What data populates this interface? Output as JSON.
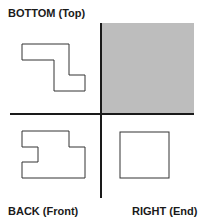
{
  "diagram": {
    "views": [
      {
        "id": "bottom",
        "label": "BOTTOM (Top)",
        "position": "top-left",
        "shape": "z-shaped outline"
      },
      {
        "id": "shaded",
        "label": "",
        "position": "top-right",
        "shape": "shaded gray square (unused quadrant)"
      },
      {
        "id": "back",
        "label": "BACK (Front)",
        "position": "bottom-left",
        "shape": "notched rectangle outline"
      },
      {
        "id": "right",
        "label": "RIGHT (End)",
        "position": "bottom-right",
        "shape": "square outline"
      }
    ],
    "colors": {
      "line": "#1a1a1a",
      "shape_stroke": "#333333",
      "shaded_fill": "#bdbdbd",
      "background": "#ffffff"
    }
  }
}
